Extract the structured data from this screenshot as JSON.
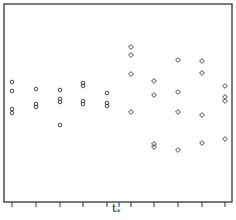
{
  "chart_data": {
    "type": "scatter",
    "title": "",
    "xlabel": "",
    "ylabel": "",
    "grid": false,
    "legend": null,
    "x_marker": {
      "label": "t",
      "subscript": "*",
      "position_between_groups": [
        5,
        6
      ]
    },
    "frame": {
      "left": 4,
      "top": 4,
      "right": 232,
      "bottom": 202
    },
    "tick_positions_px": [
      12,
      36,
      60,
      83,
      107,
      119,
      131,
      154,
      178,
      202,
      225
    ],
    "series": [
      {
        "name": "before t*",
        "marker": "circle",
        "groups": [
          {
            "x_px": 12,
            "y_px": [
              82,
              91,
              109,
              113
            ]
          },
          {
            "x_px": 36,
            "y_px": [
              89,
              104,
              107
            ]
          },
          {
            "x_px": 60,
            "y_px": [
              90,
              99,
              102,
              125
            ]
          },
          {
            "x_px": 83,
            "y_px": [
              83,
              86,
              101,
              104
            ]
          },
          {
            "x_px": 107,
            "y_px": [
              93,
              103,
              106
            ]
          }
        ]
      },
      {
        "name": "after t*",
        "marker": "diamond",
        "groups": [
          {
            "x_px": 131,
            "y_px": [
              47,
              55,
              74,
              112
            ]
          },
          {
            "x_px": 154,
            "y_px": [
              81,
              95,
              144,
              147
            ]
          },
          {
            "x_px": 178,
            "y_px": [
              60,
              92,
              112,
              150
            ]
          },
          {
            "x_px": 202,
            "y_px": [
              61,
              73,
              115,
              143
            ]
          },
          {
            "x_px": 225,
            "y_px": [
              86,
              97,
              101,
              139
            ]
          }
        ]
      }
    ]
  },
  "axis": {
    "marker_label": "t",
    "marker_sub": "*"
  },
  "colors": {
    "frame": "#333333",
    "marker": "#333333",
    "background": "#ffffff"
  }
}
